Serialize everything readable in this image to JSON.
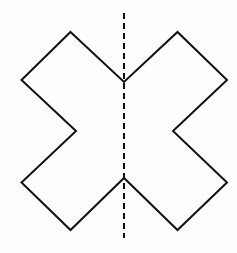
{
  "diagram": {
    "shape": {
      "name": "x-shape",
      "stroke": "#111111",
      "stroke_width": 2,
      "fill": "none",
      "points": [
        [
          70.5,
          32
        ],
        [
          124,
          82
        ],
        [
          177.5,
          32
        ],
        [
          227,
          80
        ],
        [
          173,
          131
        ],
        [
          227,
          182.5
        ],
        [
          177.5,
          230
        ],
        [
          124,
          178
        ],
        [
          70.5,
          230
        ],
        [
          21.5,
          182.5
        ],
        [
          76,
          131
        ],
        [
          21.5,
          80
        ]
      ]
    },
    "symmetry_line": {
      "name": "vertical-dashed-line",
      "x": 124,
      "y1": 13,
      "y2": 238,
      "stroke": "#111111",
      "stroke_width": 2,
      "dash": "6 4"
    }
  }
}
